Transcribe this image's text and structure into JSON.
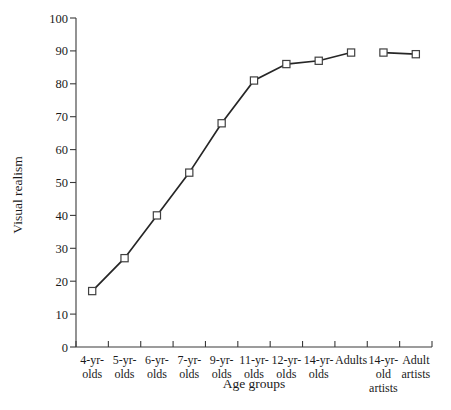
{
  "chart_data": {
    "type": "line",
    "title": "",
    "xlabel": "Age groups",
    "ylabel": "Visual realism",
    "categories": [
      "4-yr-olds",
      "5-yr-olds",
      "6-yr-olds",
      "7-yr-olds",
      "9-yr-olds",
      "11-yr-olds",
      "12-yr-olds",
      "14-yr-olds",
      "Adults",
      "14-yr-old artists",
      "Adult artists"
    ],
    "category_lines": [
      [
        "4-yr-",
        "olds"
      ],
      [
        "5-yr-",
        "olds"
      ],
      [
        "6-yr-",
        "olds"
      ],
      [
        "7-yr-",
        "olds"
      ],
      [
        "9-yr-",
        "olds"
      ],
      [
        "11-yr-",
        "olds"
      ],
      [
        "12-yr-",
        "olds"
      ],
      [
        "14-yr-",
        "olds"
      ],
      [
        "Adults"
      ],
      [
        "14-yr-",
        "old",
        "artists"
      ],
      [
        "Adult",
        "artists"
      ]
    ],
    "values": [
      17,
      27,
      40,
      53,
      68,
      81,
      86,
      87,
      89.5,
      89.5,
      89
    ],
    "segments": [
      {
        "name": "non-artists",
        "categories": [
          "4-yr-olds",
          "5-yr-olds",
          "6-yr-olds",
          "7-yr-olds",
          "9-yr-olds",
          "11-yr-olds",
          "12-yr-olds",
          "14-yr-olds",
          "Adults"
        ],
        "values": [
          17,
          27,
          40,
          53,
          68,
          81,
          86,
          87,
          89.5
        ]
      },
      {
        "name": "artists",
        "categories": [
          "14-yr-old artists",
          "Adult artists"
        ],
        "values": [
          89.5,
          89
        ]
      }
    ],
    "ylim": [
      0,
      100
    ],
    "yticks": [
      0,
      10,
      20,
      30,
      40,
      50,
      60,
      70,
      80,
      90,
      100
    ],
    "ytick_labels": [
      "0",
      "10",
      "20",
      "30",
      "40",
      "50",
      "60",
      "70",
      "80",
      "90",
      "100"
    ],
    "grid": false,
    "legend": "none",
    "marker": "open-square",
    "line_color": "#262626",
    "marker_fill": "#ffffff",
    "marker_stroke": "#404040",
    "axis_color": "#3a3a3a"
  }
}
